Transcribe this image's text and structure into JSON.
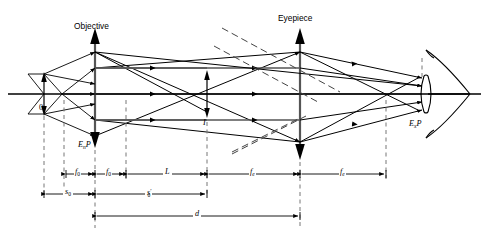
{
  "figure": {
    "type": "optical-ray-diagram",
    "background_color": "#ffffff",
    "line_color": "#000000",
    "dashed_color": "#555555"
  },
  "labels": {
    "objective": "Objective",
    "eyepiece": "Eyepiece",
    "object": "0",
    "intermediate_image": "I",
    "entrance_pupil": "E",
    "entrance_pupil_sub": "n",
    "entrance_pupil_tail": "P",
    "exit_pupil": "E",
    "exit_pupil_sub": "x",
    "exit_pupil_tail": "P"
  },
  "dimensions": [
    {
      "name": "f0-left",
      "symbol": "f",
      "sub": "0",
      "prime": ""
    },
    {
      "name": "f0-right",
      "symbol": "f",
      "sub": "0",
      "prime": ""
    },
    {
      "name": "L",
      "symbol": "L",
      "sub": "",
      "prime": ""
    },
    {
      "name": "fe-left",
      "symbol": "f",
      "sub": "e",
      "prime": ""
    },
    {
      "name": "fe-right",
      "symbol": "f",
      "sub": "e",
      "prime": ""
    },
    {
      "name": "s0",
      "symbol": "s",
      "sub": "0",
      "prime": ""
    },
    {
      "name": "s0-prime",
      "symbol": "s",
      "sub": "0",
      "prime": "′"
    },
    {
      "name": "d",
      "symbol": "d",
      "sub": "",
      "prime": ""
    }
  ],
  "dim_text": {
    "f0_left": "f",
    "f0_left_sub": "0",
    "f0_right": "f",
    "f0_right_sub": "0",
    "L": "L",
    "fe_left": "f",
    "fe_left_sub": "e",
    "fe_right": "f",
    "fe_right_sub": "e",
    "s0": "s",
    "s0_sub": "0",
    "s0p": "s",
    "s0p_sub": "0",
    "s0p_prime": "′",
    "d": "d"
  },
  "geometry": {
    "axis_y": 94,
    "axis_x_start": 8,
    "axis_x_end": 481,
    "objective_x": 95,
    "eyepiece_x": 300,
    "object_x": 44,
    "image_x": 207,
    "exit_pupil_x": 422,
    "objective_top_y": 28,
    "objective_bottom_y": 140,
    "eyepiece_top_y": 28,
    "eyepiece_bottom_y": 152
  }
}
